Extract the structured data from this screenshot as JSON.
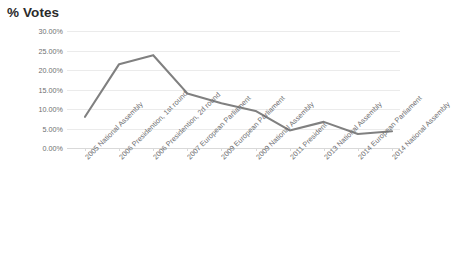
{
  "chart_data": {
    "type": "line",
    "title": "% Votes",
    "xlabel": "",
    "ylabel": "",
    "categories": [
      "2005 National Assembly",
      "2006 Presidention, 1st round",
      "2006 Presidention, 2d round",
      "2007 European Parliament",
      "2009 European Parliament",
      "2009 National Assembly",
      "2011 President",
      "2013 National Assembly",
      "2014 European Parliament",
      "2014 National Assembly"
    ],
    "values": [
      8.0,
      21.5,
      23.8,
      14.0,
      11.5,
      9.5,
      4.5,
      6.7,
      3.6,
      4.3
    ],
    "ylim": [
      0,
      30
    ],
    "yticks": [
      0,
      5,
      10,
      15,
      20,
      25,
      30
    ],
    "ytick_labels": [
      "0.00%",
      "5.00%",
      "10.00%",
      "15.00%",
      "20.00%",
      "25.00%",
      "30.00%"
    ],
    "grid": true,
    "legend": "none",
    "series_color": "#808080",
    "grid_color": "#ebebeb",
    "axis_color": "#d9d9d9",
    "text_color": "#6e6e70",
    "title_color": "#2b2b2b",
    "background": "#ffffff"
  }
}
